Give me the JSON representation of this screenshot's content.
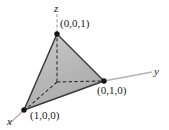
{
  "figure": {
    "type": "3d-coordinate-diagram",
    "background_color": "#ffffff",
    "axes": [
      {
        "id": "z",
        "label": "z",
        "orientation": "vertical-up",
        "color": "#b3b3b3"
      },
      {
        "id": "y",
        "label": "y",
        "orientation": "horizontal-right",
        "color": "#b3b3b3"
      },
      {
        "id": "x",
        "label": "x",
        "orientation": "diagonal-lower-left",
        "color": "#b3b3b3"
      }
    ],
    "vertices": [
      {
        "id": "v-z",
        "label": "(0,0,1)",
        "px": [
          57,
          34
        ]
      },
      {
        "id": "v-y",
        "label": "(0,1,0)",
        "px": [
          104,
          81
        ]
      },
      {
        "id": "v-x",
        "label": "(1,0,0)",
        "px": [
          24,
          110
        ]
      },
      {
        "id": "origin",
        "label": "",
        "px": [
          57,
          82
        ]
      }
    ],
    "colors": {
      "face_front": "#b9b9b9",
      "face_left": "#d2d2d2",
      "face_top": "#c4c4c4",
      "edge": "#3b3b3b",
      "dashed_edge": "#2f2f2f",
      "axis": "#b3b3b3",
      "vertex_dot": "#141414",
      "label_text": "#1a1a1a"
    }
  }
}
